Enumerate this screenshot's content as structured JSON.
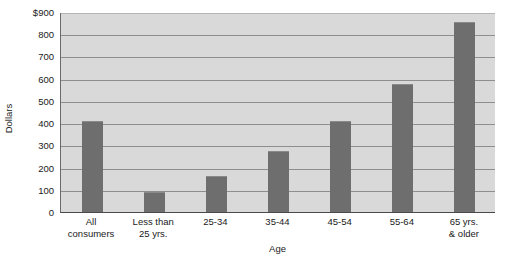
{
  "chart_data": {
    "type": "bar",
    "title": "",
    "xlabel": "Age",
    "ylabel": "Dollars",
    "categories": [
      "All consumers",
      "Less than 25 yrs.",
      "25-34",
      "35-44",
      "45-54",
      "55-64",
      "65 yrs. & older"
    ],
    "category_lines": [
      [
        "All",
        "consumers"
      ],
      [
        "Less than",
        "25 yrs."
      ],
      [
        "25-34"
      ],
      [
        "35-44"
      ],
      [
        "45-54"
      ],
      [
        "55-64"
      ],
      [
        "65 yrs.",
        "& older"
      ]
    ],
    "values": [
      415,
      95,
      165,
      280,
      415,
      580,
      860
    ],
    "ylim": [
      0,
      900
    ],
    "ytick_values": [
      0,
      100,
      200,
      300,
      400,
      500,
      600,
      700,
      800,
      900
    ],
    "ytick_labels": [
      "0",
      "100",
      "200",
      "300",
      "400",
      "500",
      "600",
      "700",
      "800",
      "$900"
    ],
    "grid": true,
    "grid_axis": "y",
    "legend": false,
    "bar_color": "#6e6e6e",
    "plot_background": "#d9d9d9",
    "gridline_color": "#8e8e8e",
    "axis_color": "#4a4a4a",
    "text_color": "#1a1a1a"
  }
}
